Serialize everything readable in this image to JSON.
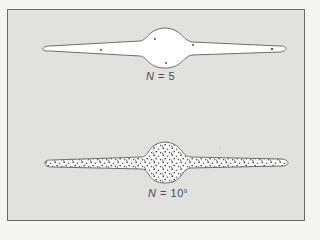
{
  "figure": {
    "panels": [
      {
        "id": "small-n",
        "label": {
          "variable": "N",
          "equals": "=",
          "value": "5",
          "exponent": ""
        },
        "fill": "empty",
        "point_count_shown": 5
      },
      {
        "id": "large-n",
        "label": {
          "variable": "N",
          "equals": "=",
          "value": "10",
          "exponent": "9"
        },
        "fill": "stippled",
        "point_count_shown": "dense"
      }
    ]
  },
  "colors": {
    "page_bg": "#f4f4f2",
    "frame_bg": "#e1e1df",
    "frame_border": "#6b6b6b",
    "shape_fill": "#ffffff",
    "outline": "#6e6e6e",
    "dots": "#555555",
    "label": "#4a4a4a"
  }
}
